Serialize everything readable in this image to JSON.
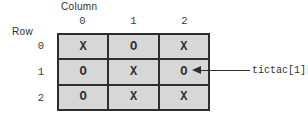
{
  "figure": {
    "column_axis_label": "Column",
    "row_axis_label": "Row",
    "column_indices": [
      "0",
      "1",
      "2"
    ],
    "row_indices": [
      "0",
      "1",
      "2"
    ],
    "grid": {
      "rows": [
        [
          "X",
          "O",
          "X"
        ],
        [
          "O",
          "X",
          "O"
        ],
        [
          "O",
          "X",
          "X"
        ]
      ]
    },
    "annotation": {
      "label": "tictac[1][2]",
      "points_to_value": "O"
    },
    "colors": {
      "cell_fill": "#d7d7d7",
      "border": "#2e2e2e",
      "text": "#2f2f2f",
      "background": "#ffffff"
    }
  }
}
